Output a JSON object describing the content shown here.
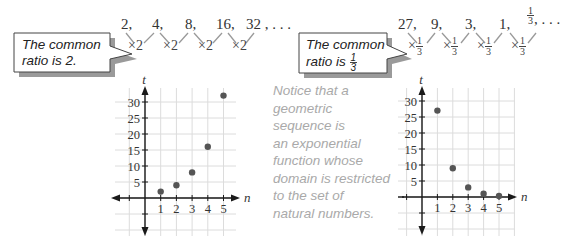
{
  "left_panel": {
    "callout_line1": "The common",
    "callout_line2": "ratio is 2.",
    "sequence_terms": [
      "2,",
      "4,",
      "8,",
      "16,",
      "32 , . . ."
    ],
    "ratio_labels": [
      "×2",
      "×2",
      "×2",
      "×2"
    ]
  },
  "right_panel": {
    "callout_line1": "The common",
    "callout_line2_prefix": "ratio is ",
    "callout_fraction": {
      "num": "1",
      "den": "3"
    },
    "sequence_terms": [
      "27,",
      "9,",
      "3,",
      "1,"
    ],
    "last_term_fraction": {
      "num": "1",
      "den": "3"
    },
    "last_term_suffix": ", . . .",
    "ratio_prefix": "×",
    "ratio_fraction": {
      "num": "1",
      "den": "3"
    }
  },
  "note": {
    "lines": [
      "Notice that a",
      "geometric",
      "sequence is",
      "an exponential",
      "function whose",
      "domain is restricted",
      "to the set of",
      "natural numbers."
    ]
  },
  "colors": {
    "axis": "#1a1a1a",
    "grid": "#dcdcdc",
    "point": "#555555",
    "note_text": "#a9a9a9",
    "callout_fill": "#ffffff",
    "callout_shadow": "#9a9a9a"
  },
  "chart_data": [
    {
      "type": "scatter",
      "title": "",
      "xlabel": "n",
      "ylabel": "t",
      "x": [
        1,
        2,
        3,
        4,
        5
      ],
      "y": [
        2,
        4,
        8,
        16,
        32
      ],
      "xticks": [
        "1",
        "2",
        "3",
        "4",
        "5"
      ],
      "yticks": [
        "5",
        "10",
        "15",
        "20",
        "25",
        "30"
      ],
      "xlim": [
        -2,
        6
      ],
      "ylim": [
        -10,
        35
      ],
      "grid": true,
      "legend": "none"
    },
    {
      "type": "scatter",
      "title": "",
      "xlabel": "n",
      "ylabel": "t",
      "x": [
        1,
        2,
        3,
        4,
        5
      ],
      "y": [
        27,
        9,
        3,
        1,
        0.333
      ],
      "xticks": [
        "1",
        "2",
        "3",
        "4",
        "5"
      ],
      "yticks": [
        "5",
        "10",
        "15",
        "20",
        "25",
        "30"
      ],
      "xlim": [
        -2,
        6
      ],
      "ylim": [
        -10,
        35
      ],
      "grid": true,
      "legend": "none"
    }
  ]
}
